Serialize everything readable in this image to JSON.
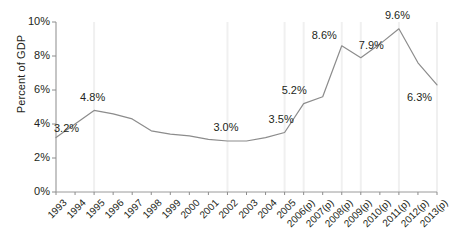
{
  "chart_data": {
    "type": "line",
    "title": "",
    "xlabel": "",
    "ylabel": "Percent of GDP",
    "ylim": [
      0,
      10
    ],
    "yticks": [
      0,
      2,
      4,
      6,
      8,
      10
    ],
    "ytick_labels": [
      "0%",
      "2%",
      "4%",
      "6%",
      "8%",
      "10%"
    ],
    "grid": "vertical-faint-at-labeled-points",
    "legend": "none",
    "categories": [
      "1993",
      "1994",
      "1995",
      "1996",
      "1997",
      "1998",
      "1999",
      "2000",
      "2001",
      "2002",
      "2003",
      "2004",
      "2005",
      "2006(p)",
      "2007(p)",
      "2008(p)",
      "2009(p)",
      "2010(p)",
      "2011(p)",
      "2012(p)",
      "2013(p)"
    ],
    "values": [
      3.2,
      4.0,
      4.8,
      4.6,
      4.3,
      3.6,
      3.4,
      3.3,
      3.1,
      3.0,
      3.0,
      3.2,
      3.5,
      5.2,
      5.6,
      8.6,
      7.9,
      8.7,
      9.6,
      7.6,
      6.3
    ],
    "point_labels": [
      {
        "category": "1993",
        "value": 3.2,
        "text": "3.2%"
      },
      {
        "category": "1995",
        "value": 4.8,
        "text": "4.8%"
      },
      {
        "category": "2002",
        "value": 3.0,
        "text": "3.0%"
      },
      {
        "category": "2005",
        "value": 3.5,
        "text": "3.5%"
      },
      {
        "category": "2006(p)",
        "value": 5.2,
        "text": "5.2%"
      },
      {
        "category": "2008(p)",
        "value": 8.6,
        "text": "8.6%"
      },
      {
        "category": "2009(p)",
        "value": 7.9,
        "text": "7.9%"
      },
      {
        "category": "2011(p)",
        "value": 9.6,
        "text": "9.6%"
      },
      {
        "category": "2013(p)",
        "value": 6.3,
        "text": "6.3%"
      }
    ],
    "colors": {
      "line": "#8c8c8c",
      "axis": "#8c8c8c",
      "grid": "#f0f0f0",
      "text": "#231f20",
      "background": "#ffffff"
    }
  }
}
